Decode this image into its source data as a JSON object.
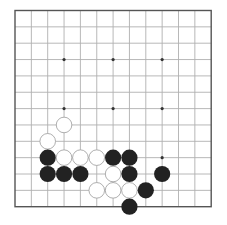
{
  "board": {
    "size": 13,
    "origin_x": 15,
    "origin_y": 10.5,
    "spacing": 16.35,
    "line_color": "#b0b0b0",
    "border_color": "#555555",
    "star_color": "#333333",
    "black_color": "#222222",
    "white_fill": "#ffffff",
    "white_stroke": "#9a9a9a",
    "star_points": [
      [
        3,
        3
      ],
      [
        6,
        3
      ],
      [
        9,
        3
      ],
      [
        3,
        6
      ],
      [
        6,
        6
      ],
      [
        9,
        6
      ],
      [
        9,
        9
      ]
    ],
    "stones": [
      {
        "color": "white",
        "col": 3,
        "row": 7
      },
      {
        "color": "white",
        "col": 2,
        "row": 8
      },
      {
        "color": "black",
        "col": 2,
        "row": 9
      },
      {
        "color": "white",
        "col": 3,
        "row": 9
      },
      {
        "color": "white",
        "col": 4,
        "row": 9
      },
      {
        "color": "white",
        "col": 5,
        "row": 9
      },
      {
        "color": "black",
        "col": 6,
        "row": 9
      },
      {
        "color": "black",
        "col": 7,
        "row": 9
      },
      {
        "color": "black",
        "col": 2,
        "row": 10
      },
      {
        "color": "black",
        "col": 3,
        "row": 10
      },
      {
        "color": "black",
        "col": 4,
        "row": 10
      },
      {
        "color": "white",
        "col": 6,
        "row": 10
      },
      {
        "color": "black",
        "col": 7,
        "row": 10
      },
      {
        "color": "black",
        "col": 9,
        "row": 10
      },
      {
        "color": "white",
        "col": 5,
        "row": 11
      },
      {
        "color": "white",
        "col": 6,
        "row": 11
      },
      {
        "color": "white",
        "col": 7,
        "row": 11
      },
      {
        "color": "black",
        "col": 8,
        "row": 11
      },
      {
        "color": "black",
        "col": 7,
        "row": 12
      }
    ]
  }
}
